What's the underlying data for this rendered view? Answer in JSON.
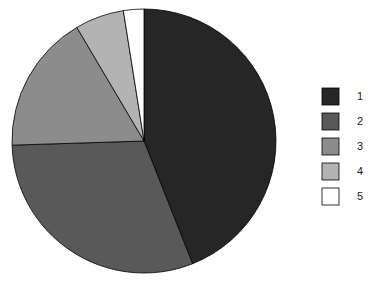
{
  "chart_data": {
    "type": "pie",
    "title": "",
    "subtitle": "",
    "xlabel": "",
    "ylabel": "",
    "grid": false,
    "categories": [
      "1",
      "2",
      "3",
      "4",
      "5"
    ],
    "values": [
      44.0,
      30.5,
      17.0,
      6.0,
      2.5
    ],
    "value_unit": "percent",
    "start_angle_deg": 90,
    "direction": "clockwise",
    "slice_colors": [
      "#262626",
      "#595959",
      "#8c8c8c",
      "#b3b3b3",
      "#ffffff"
    ],
    "slice_edge_color": "#000000",
    "legend": {
      "position": "right",
      "entries": [
        {
          "label": "1",
          "color": "#262626"
        },
        {
          "label": "2",
          "color": "#595959"
        },
        {
          "label": "3",
          "color": "#8c8c8c"
        },
        {
          "label": "4",
          "color": "#b3b3b3"
        },
        {
          "label": "5",
          "color": "#ffffff"
        }
      ]
    },
    "annotations": []
  },
  "figure": {
    "background_color": "#ffffff",
    "pie": {
      "center_x": 144,
      "center_y": 141,
      "radius": 132
    }
  },
  "legend_items": [
    {
      "label": "1",
      "color": "#262626",
      "swatch_y": 88
    },
    {
      "label": "2",
      "color": "#595959",
      "swatch_y": 113
    },
    {
      "label": "3",
      "color": "#8c8c8c",
      "swatch_y": 138
    },
    {
      "label": "4",
      "color": "#b3b3b3",
      "swatch_y": 163
    },
    {
      "label": "5",
      "color": "#ffffff",
      "swatch_y": 188
    }
  ]
}
